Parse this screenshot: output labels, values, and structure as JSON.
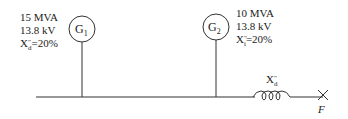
{
  "diagram": {
    "type": "single-line power system diagram",
    "generators": [
      {
        "id": "G1",
        "symbol": "G",
        "subscript": "1",
        "rating": "15 MVA",
        "voltage": "13.8 kV",
        "reactance_label": "X",
        "reactance_sub": "d",
        "reactance_sup": "\"",
        "reactance_value": "=20%"
      },
      {
        "id": "G2",
        "symbol": "G",
        "subscript": "2",
        "rating": "10 MVA",
        "voltage": "13.8 kV",
        "reactance_label": "X",
        "reactance_sub": "i",
        "reactance_sup": "\"",
        "reactance_value": "=20%"
      }
    ],
    "reactor": {
      "label": "X",
      "sub": "d",
      "sup": "\""
    },
    "fault": {
      "label": "F"
    },
    "colors": {
      "line": "#333333",
      "text": "#222222"
    }
  }
}
